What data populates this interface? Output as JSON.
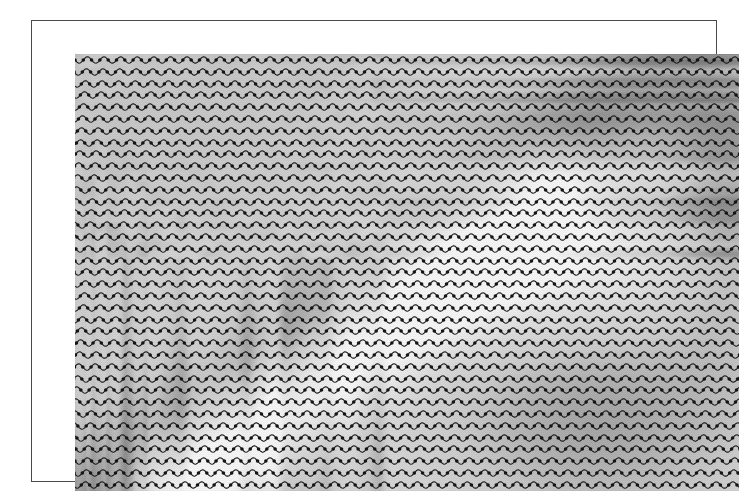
{
  "figure": {
    "kind": "wave-profile-overlay-plot",
    "title": "",
    "frame": {
      "border_color": "#4a4a4a",
      "background_color": "#ffffff",
      "outer_left": 31,
      "outer_top": 20,
      "outer_width": 686,
      "outer_height": 462
    },
    "plot": {
      "left": 43,
      "top": 33,
      "width": 664,
      "height": 437,
      "background_color": "#c9c9c9"
    }
  },
  "overlay": {
    "name": "sinusoidal-profile-lines",
    "line_color": "#1c1c1c",
    "line_width": 1.1,
    "marker_shape": "dot",
    "marker_color": "#141414",
    "marker_radius": 1.8,
    "row_count": 37,
    "row_spacing_px": 11.8,
    "wave_period_px": 16.6,
    "wave_amplitude_px": 3.2,
    "markers_per_period": 2,
    "first_row_y_px": 6
  },
  "background_image": {
    "name": "grayscale-terrain-relief",
    "description": "shaded relief of a mountainous terrain with a bright diagonal ridge running from lower-left to upper-right and darker valley regions",
    "gray_light": "#f2f2f2",
    "gray_mid": "#c9c9c9",
    "gray_dark": "#8e8e8e",
    "gray_darkest": "#6e6e6e",
    "dither": true
  },
  "chart_data": {
    "type": "line",
    "title": "",
    "xlabel": "",
    "ylabel": "",
    "grid": false,
    "legend": "none",
    "xlim": [
      0,
      664
    ],
    "ylim": [
      0,
      437
    ],
    "categories": [],
    "series": [
      {
        "name": "profile-row-1",
        "baseline_y": 6,
        "amplitude": 3.2,
        "period": 16.6,
        "marker_count": 80
      },
      {
        "name": "profile-row-2",
        "baseline_y": 18,
        "amplitude": 3.2,
        "period": 16.6,
        "marker_count": 80
      },
      {
        "name": "profile-row-3",
        "baseline_y": 30,
        "amplitude": 3.2,
        "period": 16.6,
        "marker_count": 80
      },
      {
        "name": "profile-row-4",
        "baseline_y": 41,
        "amplitude": 3.2,
        "period": 16.6,
        "marker_count": 80
      },
      {
        "name": "profile-row-5",
        "baseline_y": 53,
        "amplitude": 3.2,
        "period": 16.6,
        "marker_count": 80
      },
      {
        "name": "profile-row-6",
        "baseline_y": 65,
        "amplitude": 3.2,
        "period": 16.6,
        "marker_count": 80
      },
      {
        "name": "profile-row-7",
        "baseline_y": 77,
        "amplitude": 3.2,
        "period": 16.6,
        "marker_count": 80
      },
      {
        "name": "profile-row-8",
        "baseline_y": 89,
        "amplitude": 3.2,
        "period": 16.6,
        "marker_count": 80
      },
      {
        "name": "profile-row-9",
        "baseline_y": 100,
        "amplitude": 3.2,
        "period": 16.6,
        "marker_count": 80
      },
      {
        "name": "profile-row-10",
        "baseline_y": 112,
        "amplitude": 3.2,
        "period": 16.6,
        "marker_count": 80
      },
      {
        "name": "profile-row-11",
        "baseline_y": 124,
        "amplitude": 3.2,
        "period": 16.6,
        "marker_count": 80
      },
      {
        "name": "profile-row-12",
        "baseline_y": 136,
        "amplitude": 3.2,
        "period": 16.6,
        "marker_count": 80
      },
      {
        "name": "profile-row-13",
        "baseline_y": 148,
        "amplitude": 3.2,
        "period": 16.6,
        "marker_count": 80
      },
      {
        "name": "profile-row-14",
        "baseline_y": 159,
        "amplitude": 3.2,
        "period": 16.6,
        "marker_count": 80
      },
      {
        "name": "profile-row-15",
        "baseline_y": 171,
        "amplitude": 3.2,
        "period": 16.6,
        "marker_count": 80
      },
      {
        "name": "profile-row-16",
        "baseline_y": 183,
        "amplitude": 3.2,
        "period": 16.6,
        "marker_count": 80
      },
      {
        "name": "profile-row-17",
        "baseline_y": 195,
        "amplitude": 3.2,
        "period": 16.6,
        "marker_count": 80
      },
      {
        "name": "profile-row-18",
        "baseline_y": 207,
        "amplitude": 3.2,
        "period": 16.6,
        "marker_count": 80
      },
      {
        "name": "profile-row-19",
        "baseline_y": 218,
        "amplitude": 3.2,
        "period": 16.6,
        "marker_count": 80
      },
      {
        "name": "profile-row-20",
        "baseline_y": 230,
        "amplitude": 3.2,
        "period": 16.6,
        "marker_count": 80
      },
      {
        "name": "profile-row-21",
        "baseline_y": 242,
        "amplitude": 3.2,
        "period": 16.6,
        "marker_count": 80
      },
      {
        "name": "profile-row-22",
        "baseline_y": 254,
        "amplitude": 3.2,
        "period": 16.6,
        "marker_count": 80
      },
      {
        "name": "profile-row-23",
        "baseline_y": 266,
        "amplitude": 3.2,
        "period": 16.6,
        "marker_count": 80
      },
      {
        "name": "profile-row-24",
        "baseline_y": 277,
        "amplitude": 3.2,
        "period": 16.6,
        "marker_count": 80
      },
      {
        "name": "profile-row-25",
        "baseline_y": 289,
        "amplitude": 3.2,
        "period": 16.6,
        "marker_count": 80
      },
      {
        "name": "profile-row-26",
        "baseline_y": 301,
        "amplitude": 3.2,
        "period": 16.6,
        "marker_count": 80
      },
      {
        "name": "profile-row-27",
        "baseline_y": 313,
        "amplitude": 3.2,
        "period": 16.6,
        "marker_count": 80
      },
      {
        "name": "profile-row-28",
        "baseline_y": 325,
        "amplitude": 3.2,
        "period": 16.6,
        "marker_count": 80
      },
      {
        "name": "profile-row-29",
        "baseline_y": 336,
        "amplitude": 3.2,
        "period": 16.6,
        "marker_count": 80
      },
      {
        "name": "profile-row-30",
        "baseline_y": 348,
        "amplitude": 3.2,
        "period": 16.6,
        "marker_count": 80
      },
      {
        "name": "profile-row-31",
        "baseline_y": 360,
        "amplitude": 3.2,
        "period": 16.6,
        "marker_count": 80
      },
      {
        "name": "profile-row-32",
        "baseline_y": 372,
        "amplitude": 3.2,
        "period": 16.6,
        "marker_count": 80
      },
      {
        "name": "profile-row-33",
        "baseline_y": 384,
        "amplitude": 3.2,
        "period": 16.6,
        "marker_count": 80
      },
      {
        "name": "profile-row-34",
        "baseline_y": 395,
        "amplitude": 3.2,
        "period": 16.6,
        "marker_count": 80
      },
      {
        "name": "profile-row-35",
        "baseline_y": 407,
        "amplitude": 3.2,
        "period": 16.6,
        "marker_count": 80
      },
      {
        "name": "profile-row-36",
        "baseline_y": 419,
        "amplitude": 3.2,
        "period": 16.6,
        "marker_count": 80
      },
      {
        "name": "profile-row-37",
        "baseline_y": 431,
        "amplitude": 3.2,
        "period": 16.6,
        "marker_count": 80
      }
    ],
    "terrain_features": [
      {
        "name": "bright-diagonal-ridge",
        "from": [
          110,
          430
        ],
        "to": [
          470,
          150
        ],
        "tone": "light"
      },
      {
        "name": "dark-valley-lower-right",
        "center": [
          520,
          360
        ],
        "tone": "dark"
      },
      {
        "name": "dark-band-right-edge",
        "center": [
          650,
          140
        ],
        "tone": "dark"
      },
      {
        "name": "bright-plateau-upper-middle",
        "center": [
          430,
          200
        ],
        "tone": "light"
      },
      {
        "name": "uniform-gray-upper-left",
        "center": [
          180,
          90
        ],
        "tone": "mid"
      }
    ]
  }
}
